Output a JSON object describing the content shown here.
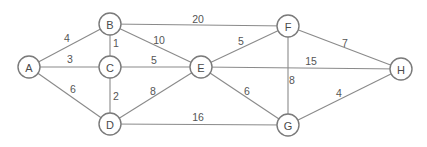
{
  "diagram": {
    "type": "weighted-undirected-graph",
    "colors": {
      "background": "#ffffff",
      "edge": "#8a8a8a",
      "node_stroke": "#7a7a7a",
      "text": "#4a4a4a"
    },
    "nodes": [
      {
        "id": "A",
        "label": "A",
        "x": 29,
        "y": 67
      },
      {
        "id": "B",
        "label": "B",
        "x": 110,
        "y": 24
      },
      {
        "id": "C",
        "label": "C",
        "x": 110,
        "y": 67
      },
      {
        "id": "D",
        "label": "D",
        "x": 110,
        "y": 124
      },
      {
        "id": "E",
        "label": "E",
        "x": 201,
        "y": 67
      },
      {
        "id": "F",
        "label": "F",
        "x": 288,
        "y": 26
      },
      {
        "id": "G",
        "label": "G",
        "x": 288,
        "y": 125
      },
      {
        "id": "H",
        "label": "H",
        "x": 401,
        "y": 69
      }
    ],
    "edges": [
      {
        "from": "A",
        "to": "B",
        "weight": "4",
        "lx": 67,
        "ly": 38
      },
      {
        "from": "A",
        "to": "C",
        "weight": "3",
        "lx": 70,
        "ly": 59
      },
      {
        "from": "A",
        "to": "D",
        "weight": "6",
        "lx": 73,
        "ly": 89
      },
      {
        "from": "B",
        "to": "C",
        "weight": "1",
        "lx": 116,
        "ly": 43
      },
      {
        "from": "B",
        "to": "E",
        "weight": "10",
        "lx": 159,
        "ly": 40
      },
      {
        "from": "B",
        "to": "F",
        "weight": "20",
        "lx": 198,
        "ly": 19
      },
      {
        "from": "C",
        "to": "E",
        "weight": "5",
        "lx": 154,
        "ly": 60
      },
      {
        "from": "C",
        "to": "D",
        "weight": "2",
        "lx": 116,
        "ly": 96
      },
      {
        "from": "D",
        "to": "E",
        "weight": "8",
        "lx": 153,
        "ly": 91
      },
      {
        "from": "D",
        "to": "G",
        "weight": "16",
        "lx": 198,
        "ly": 117
      },
      {
        "from": "E",
        "to": "F",
        "weight": "5",
        "lx": 241,
        "ly": 41
      },
      {
        "from": "E",
        "to": "H",
        "weight": "15",
        "lx": 311,
        "ly": 61
      },
      {
        "from": "E",
        "to": "G",
        "weight": "6",
        "lx": 247,
        "ly": 91
      },
      {
        "from": "F",
        "to": "G",
        "weight": "8",
        "lx": 292,
        "ly": 80
      },
      {
        "from": "F",
        "to": "H",
        "weight": "7",
        "lx": 345,
        "ly": 43
      },
      {
        "from": "G",
        "to": "H",
        "weight": "4",
        "lx": 339,
        "ly": 93
      }
    ]
  }
}
